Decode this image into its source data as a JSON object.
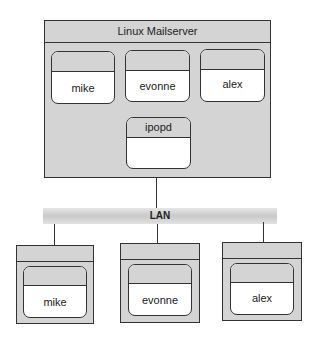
{
  "server": {
    "title": "Linux Mailserver",
    "users": [
      {
        "label": "mike"
      },
      {
        "label": "evonne"
      },
      {
        "label": "alex"
      }
    ],
    "daemon": {
      "label": "ipopd"
    }
  },
  "network": {
    "label": "LAN"
  },
  "clients": [
    {
      "label": "mike"
    },
    {
      "label": "evonne"
    },
    {
      "label": "alex"
    }
  ],
  "colors": {
    "fill_gray": "#d4d4d4",
    "stroke": "#333333",
    "node_fill": "#ffffff"
  }
}
